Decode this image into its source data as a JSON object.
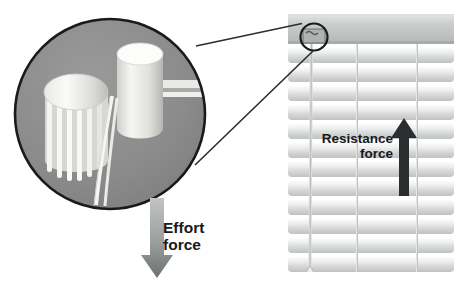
{
  "figure": {
    "type": "labeled-diagram",
    "background_color": "#ffffff"
  },
  "callout": {
    "magnifier": {
      "name": "magnified-detail-circle",
      "center_x": 110,
      "center_y": 114,
      "radius": 96,
      "fill_color": "#8c8c8c",
      "stroke_color": "#1a1a1a",
      "contents": [
        "ribbed-spool-drum",
        "smooth-cylinder-roller",
        "lift-cords"
      ]
    },
    "source_circle": {
      "name": "headrail-mechanism-circle",
      "center_x": 314,
      "center_y": 37,
      "radius": 14,
      "stroke_color": "#1a1a1a"
    },
    "connector_lines": [
      {
        "x1": 196,
        "y1": 46,
        "x2": 303,
        "y2": 24
      },
      {
        "x1": 196,
        "y1": 164,
        "x2": 314,
        "y2": 50
      }
    ]
  },
  "blinds": {
    "name": "venetian-blinds",
    "left": 288,
    "right": 454,
    "top": 14,
    "bottom": 272,
    "slat_color_light": "#f2f2f2",
    "slat_color_shade": "#c9cbcb",
    "headrail": {
      "top": 14,
      "height": 30,
      "color": "#c4c6c5"
    },
    "slat_count": 13,
    "slat_spacing": 19,
    "ladder_cords": [
      {
        "x": 357,
        "label": "ladder-cord-left"
      },
      {
        "x": 417,
        "label": "ladder-cord-right"
      }
    ],
    "pull_cord": {
      "x": 311,
      "top": 44,
      "bottom": 281,
      "tassel_label": "cord-tassel"
    }
  },
  "arrows": [
    {
      "id": "effort",
      "name": "effort-force-arrow",
      "direction": "down",
      "x": 157,
      "y_start": 198,
      "y_end": 278,
      "color_top": "#b6b8b8",
      "color_bottom": "#76797a"
    },
    {
      "id": "resistance",
      "name": "resistance-force-arrow",
      "direction": "up",
      "x": 404,
      "y_start": 196,
      "y_end": 118,
      "color": "#2b2d2f"
    }
  ],
  "labels": {
    "effort_force": "Effort\nforce",
    "resistance_force": "Resistance\nforce"
  }
}
